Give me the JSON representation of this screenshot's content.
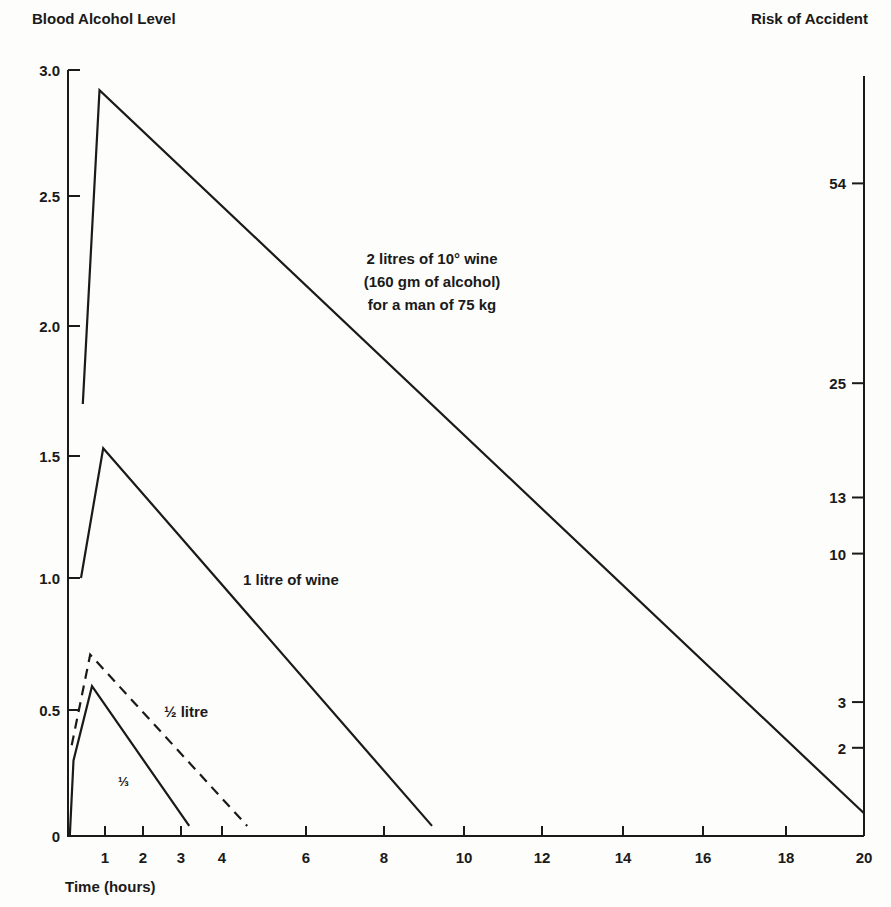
{
  "chart_data": {
    "type": "line",
    "title": "",
    "ylabel": "Blood Alcohol Level",
    "ylabel_right": "Risk of Accident",
    "xlabel": "Time (hours)",
    "ylim": [
      0,
      3.0
    ],
    "xlim": [
      0,
      20
    ],
    "grid": false,
    "y_ticks": [
      "0",
      "0.5",
      "1.0",
      "1.5",
      "2.0",
      "2.5",
      "3.0"
    ],
    "x_ticks": [
      "1",
      "2",
      "3",
      "4",
      "6",
      "8",
      "10",
      "12",
      "14",
      "16",
      "18",
      "20"
    ],
    "right_ticks": [
      {
        "label": "2",
        "bal": 0.35
      },
      {
        "label": "3",
        "bal": 0.53
      },
      {
        "label": "10",
        "bal": 1.1
      },
      {
        "label": "13",
        "bal": 1.33
      },
      {
        "label": "25",
        "bal": 1.78
      },
      {
        "label": "54",
        "bal": 2.55
      }
    ],
    "series": [
      {
        "name": "2 litres of 10° wine (160 gm of alcohol) for a man of 75 kg",
        "style": "solid",
        "points": [
          [
            0.4,
            1.7
          ],
          [
            0.85,
            2.92
          ],
          [
            20,
            0.09
          ]
        ]
      },
      {
        "name": "1 litre of wine",
        "style": "solid",
        "points": [
          [
            0.35,
            1.0
          ],
          [
            0.95,
            1.53
          ],
          [
            9.2,
            0.04
          ]
        ]
      },
      {
        "name": "½ litre",
        "style": "dashed",
        "points": [
          [
            0.1,
            0.36
          ],
          [
            0.6,
            0.71
          ],
          [
            4.6,
            0.04
          ]
        ]
      },
      {
        "name": "⅓",
        "style": "solid",
        "points": [
          [
            0.05,
            0.0
          ],
          [
            0.15,
            0.3
          ],
          [
            0.65,
            0.59
          ],
          [
            3.2,
            0.04
          ]
        ]
      }
    ],
    "annotations": [
      {
        "text_lines": [
          "2 litres of 10° wine",
          "(160 gm of alcohol)",
          "for a man of 75 kg"
        ]
      },
      {
        "text": "1 litre of wine"
      },
      {
        "text": "½ litre"
      },
      {
        "text": "⅓"
      }
    ]
  },
  "labels": {
    "left_axis_title": "Blood Alcohol Level",
    "right_axis_title": "Risk of Accident",
    "x_axis_title": "Time (hours)",
    "ann_2l_1": "2 litres of 10° wine",
    "ann_2l_2": "(160 gm of alcohol)",
    "ann_2l_3": "for a man of 75 kg",
    "ann_1l": "1 litre of wine",
    "ann_half": "½ litre",
    "ann_third": "⅓"
  }
}
